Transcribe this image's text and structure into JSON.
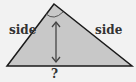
{
  "diagram": {
    "shape": "triangle",
    "labels": {
      "left_side": "side",
      "right_side": "side",
      "base": "?"
    },
    "colors": {
      "fill": "#c8c8c8",
      "stroke": "#1a1a1a",
      "background": "#f2f2f2",
      "arrow": "#444444",
      "angle_arc": "#555555"
    }
  }
}
